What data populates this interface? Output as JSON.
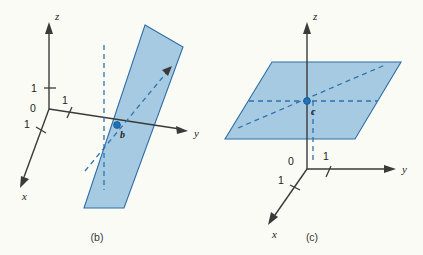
{
  "figure": {
    "background_color": "#fbfbf5",
    "plane_fill_color": "#86b7dc",
    "plane_edge_color": "#2e6ea6",
    "dash_color": "#2f72ad",
    "axis_color": "#3a3a3a",
    "point_color": "#1f72b8"
  },
  "panels": [
    {
      "id": "b",
      "caption": "(b)",
      "axes": [
        {
          "name": "z-axis",
          "label": "z"
        },
        {
          "name": "y-axis",
          "label": "y"
        },
        {
          "name": "x-axis",
          "label": "x"
        }
      ],
      "tick_labels": {
        "origin": "0",
        "z_one": "1",
        "y_one": "1",
        "x_one": "1"
      },
      "point": {
        "label": "b"
      },
      "plane_description": "vertical plane y = 1 parallel to xz-plane"
    },
    {
      "id": "c",
      "caption": "(c)",
      "axes": [
        {
          "name": "z-axis",
          "label": "z"
        },
        {
          "name": "y-axis",
          "label": "y"
        },
        {
          "name": "x-axis",
          "label": "x"
        }
      ],
      "tick_labels": {
        "origin": "0",
        "y_one": "1",
        "x_one": "1"
      },
      "point": {
        "label": "c"
      },
      "plane_description": "horizontal plane z = 1 parallel to xy-plane"
    }
  ]
}
